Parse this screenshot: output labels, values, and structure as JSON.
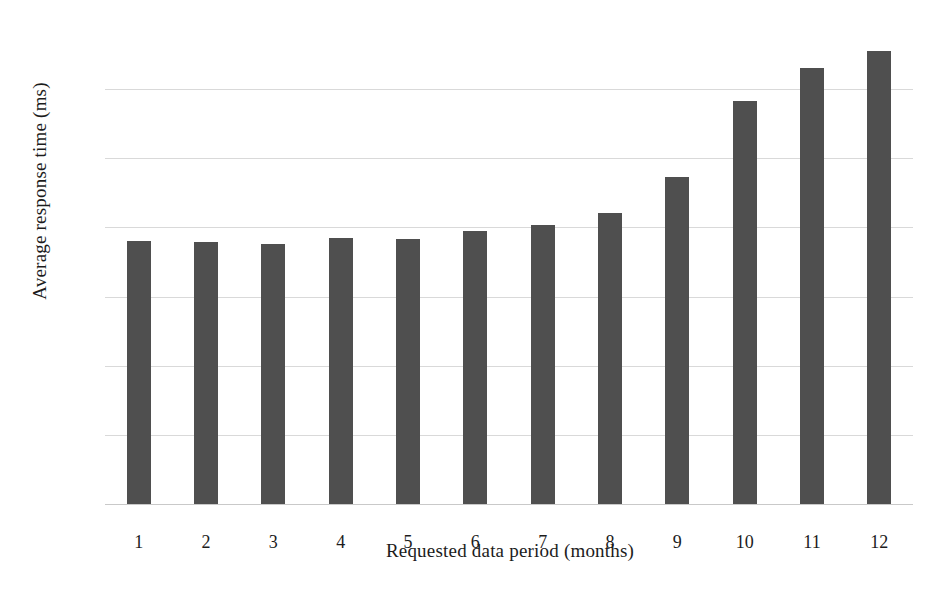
{
  "chart_data": {
    "type": "bar",
    "title": "",
    "subtitle": "",
    "xlabel": "Requested data period (months)",
    "ylabel": "Average response time (ms)",
    "categories": [
      "1",
      "2",
      "3",
      "4",
      "5",
      "6",
      "7",
      "8",
      "9",
      "10",
      "11",
      "12"
    ],
    "values": [
      762,
      759,
      753,
      770,
      767,
      789,
      808,
      841,
      945,
      1167,
      1260,
      1310
    ],
    "series": [
      {
        "name": "Average response time",
        "values": [
          762,
          759,
          753,
          770,
          767,
          789,
          808,
          841,
          945,
          1167,
          1260,
          1310
        ]
      }
    ],
    "ylim": [
      0,
      1400
    ],
    "yticks": [
      0,
      200,
      400,
      600,
      800,
      1000,
      1200
    ],
    "ytick_labels": [
      "0",
      "200",
      "400",
      "600",
      "800",
      "1,000",
      "1,200"
    ],
    "grid": true,
    "grid_axis": "y",
    "legend": false,
    "legend_position": "none",
    "bar_color": "#4f4f4f",
    "grid_color": "#d9d9d9",
    "background_color": "#ffffff",
    "text_color": "#1c1c1c"
  }
}
